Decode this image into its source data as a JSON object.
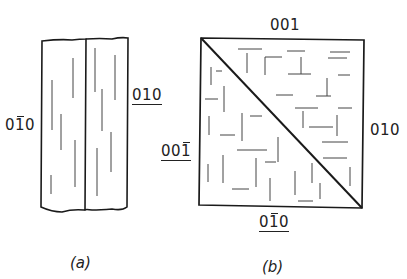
{
  "figure_a": {
    "caption": "(a)",
    "left_label": {
      "digits": [
        "0",
        "1",
        "0"
      ],
      "bar_index": 1,
      "text": "0̄1̄ 0",
      "underlined": false
    },
    "right_label": {
      "digits": [
        "0",
        "1",
        "0"
      ],
      "bar_index": null,
      "text": "010",
      "underlined": true
    },
    "description": "Two adjacent elongated crystal slabs with wavy top/bottom edges, containing vertical line striations"
  },
  "figure_b": {
    "caption": "(b)",
    "top_label": {
      "digits": [
        "0",
        "0",
        "1"
      ],
      "bar_index": null,
      "text": "001",
      "underlined": false
    },
    "right_label": {
      "digits": [
        "0",
        "1",
        "0"
      ],
      "bar_index": null,
      "text": "010",
      "underlined": false
    },
    "left_label": {
      "digits": [
        "0",
        "0",
        "1"
      ],
      "bar_index": 2,
      "text": "001̄",
      "underlined": true
    },
    "bottom_label": {
      "digits": [
        "0",
        "1",
        "0"
      ],
      "bar_index": 1,
      "text": "01̄0",
      "underlined": true
    },
    "description": "Square section divided by a diagonal from top-left to bottom-right; upper-right triangle shows mostly horizontal striations, lower-left triangle shows mostly vertical striations"
  },
  "colors": {
    "line": "#1a1a1a",
    "striation": "#444444",
    "background": "#ffffff"
  }
}
